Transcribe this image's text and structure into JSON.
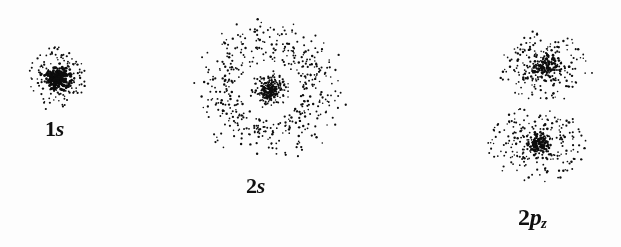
{
  "figure": {
    "background_color": "#fdfdfd",
    "dot_color": "#0d0d0d",
    "width": 621,
    "height": 247
  },
  "orbitals": [
    {
      "id": "1s",
      "label_prefix": "1",
      "label_letter": "s",
      "label_subscript": "",
      "label_text": "1s",
      "center_x": 58,
      "center_y": 78,
      "type": "s",
      "shells": [
        {
          "name": "core",
          "count": 230,
          "sigma": 5.5,
          "dot_size": 1.8
        },
        {
          "name": "halo",
          "count": 150,
          "mean_radius": 20,
          "spread": 9,
          "dot_size": 1.7
        }
      ],
      "nodes": 0
    },
    {
      "id": "2s",
      "label_prefix": "2",
      "label_letter": "s",
      "label_subscript": "",
      "label_text": "2s",
      "center_x": 270,
      "center_y": 90,
      "type": "s",
      "shells": [
        {
          "name": "inner-core",
          "count": 170,
          "sigma": 5.0,
          "dot_size": 1.8
        },
        {
          "name": "inner-shell",
          "count": 120,
          "mean_radius": 13,
          "spread": 5,
          "dot_size": 1.7
        },
        {
          "name": "outer-shell",
          "count": 560,
          "mean_radius": 47,
          "spread": 16,
          "dot_size": 1.8
        }
      ],
      "node_radius": 26,
      "nodes": 1
    },
    {
      "id": "2pz",
      "label_prefix": "2",
      "label_letter": "p",
      "label_subscript": "z",
      "label_text": "2pz",
      "center_x": 541,
      "center_y": 105,
      "type": "p",
      "lobes": [
        {
          "name": "upper-lobe",
          "center_x": 545,
          "center_y": 66,
          "count": 420,
          "radius_x": 48,
          "radius_y": 36,
          "core_count": 120,
          "core_sigma": 6.0,
          "dot_size": 1.8
        },
        {
          "name": "lower-lobe",
          "center_x": 537,
          "center_y": 144,
          "count": 440,
          "radius_x": 50,
          "radius_y": 38,
          "core_count": 130,
          "core_sigma": 6.5,
          "dot_size": 1.8
        }
      ],
      "nodal_plane_y": 105,
      "nodes": 1
    }
  ],
  "chart_data": {
    "type": "scatter",
    "xlabel": "",
    "ylabel": "",
    "legend_position": "none",
    "grid": false,
    "series": [
      {
        "name": "1s",
        "label": "1s",
        "n_dots": 380,
        "center": [
          58,
          78
        ],
        "radial_nodes": 0,
        "angular_nodes": 0,
        "shape": "spherical"
      },
      {
        "name": "2s",
        "label": "2s",
        "n_dots": 850,
        "center": [
          270,
          90
        ],
        "radial_nodes": 1,
        "angular_nodes": 0,
        "shape": "spherical-with-radial-node"
      },
      {
        "name": "2pz",
        "label": "2pz",
        "n_dots": 860,
        "center": [
          541,
          105
        ],
        "radial_nodes": 0,
        "angular_nodes": 1,
        "shape": "dumbbell-two-lobes"
      }
    ],
    "categories": [
      "1s",
      "2s",
      "2pz"
    ],
    "values": [
      380,
      850,
      860
    ]
  }
}
